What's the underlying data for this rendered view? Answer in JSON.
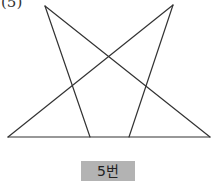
{
  "problem_number": "(5)",
  "figure": {
    "stroke_color": "#333333",
    "points": {
      "apex_left": [
        45,
        6
      ],
      "apex_right": [
        173,
        5
      ],
      "base_left": [
        8,
        137
      ],
      "base_right": [
        210,
        137
      ],
      "base_inner_left": [
        90,
        137
      ],
      "base_inner_right": [
        129,
        137
      ]
    }
  },
  "label": {
    "text": "5번",
    "background": "#b3b3b3"
  }
}
